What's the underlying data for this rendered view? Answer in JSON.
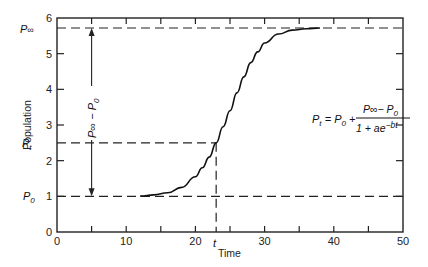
{
  "chart_data": {
    "type": "line",
    "title": "",
    "xlabel": "Time",
    "ylabel": "Population",
    "xlim": [
      0,
      50
    ],
    "ylim": [
      0,
      6
    ],
    "x_ticks": [
      0,
      10,
      20,
      30,
      40,
      50
    ],
    "x_minor_ticks": [
      5,
      15,
      25,
      35,
      45
    ],
    "y_ticks": [
      0,
      1,
      2,
      3,
      4,
      5,
      6
    ],
    "grid": false,
    "legend": null,
    "series": [
      {
        "name": "Logistic growth P_t",
        "x": [
          0,
          5,
          10,
          12,
          14,
          16,
          18,
          20,
          21,
          22,
          23,
          24,
          25,
          26,
          27,
          28,
          29,
          30,
          32,
          34,
          36,
          38,
          40
        ],
        "values": [
          1.0,
          1.0,
          1.0,
          1.01,
          1.04,
          1.1,
          1.25,
          1.55,
          1.8,
          2.1,
          2.5,
          2.95,
          3.4,
          3.9,
          4.35,
          4.75,
          5.05,
          5.3,
          5.55,
          5.66,
          5.7,
          5.72,
          5.72
        ]
      }
    ],
    "reference_lines": {
      "P_inf": 5.72,
      "P_t": 2.5,
      "P_0": 1.0,
      "t": 23
    },
    "annotations": {
      "p_inf_label": "P∞",
      "p_t_label": "Pt",
      "p_0_label": "P0",
      "t_label": "t",
      "range_arrow_label": "P∞ − P0",
      "range_arrow_x": 5,
      "equation": "Pt = P0 + (P∞ − P0) / (1 + ae^(−bt))"
    }
  },
  "labels": {
    "x_ticks": [
      "0",
      "10",
      "20",
      "30",
      "40",
      "50"
    ],
    "y_ticks": [
      "0",
      "1",
      "2",
      "3",
      "4",
      "5",
      "6"
    ],
    "xlabel": "Time",
    "ylabel": "Population",
    "p_inf": "P",
    "p_inf_sub": "∞",
    "p_t": "P",
    "p_t_sub": "t",
    "p_0": "P",
    "p_0_sub": "0",
    "t": "t",
    "eq_lhs": "P",
    "eq_lhs_sub": "t",
    "eq_eq": " = ",
    "eq_p0": "P",
    "eq_p0_sub": "0",
    "eq_plus": " +",
    "eq_num": "P∞− P",
    "eq_num_sub": "0",
    "eq_den": "1 + ae",
    "eq_den_exp": "−bt",
    "arrow_text": "P∞ − P",
    "arrow_text_sub": "0"
  }
}
